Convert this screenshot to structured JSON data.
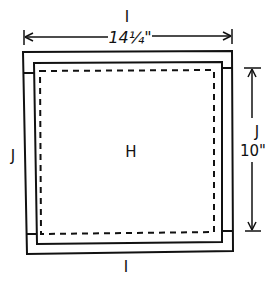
{
  "diagram": {
    "type": "quilt-block-assembly",
    "center_label": "H",
    "top_border_label": "I",
    "bottom_border_label": "I",
    "left_border_label": "J",
    "right_border_label": "J",
    "width_dimension": "14¼\"",
    "height_dimension": "10\"",
    "colors": {
      "line": "#111111",
      "background": "#ffffff"
    }
  }
}
